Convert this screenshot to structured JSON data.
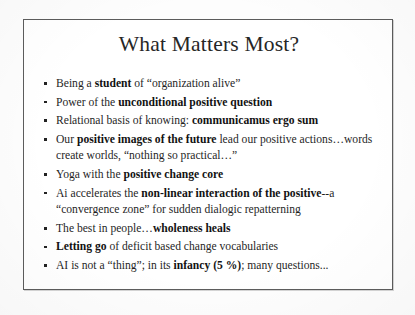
{
  "slide": {
    "title": "What Matters Most?",
    "bullets": [
      {
        "id": "bullet-student",
        "segments": [
          {
            "text": "Being a ",
            "bold": false
          },
          {
            "text": "student",
            "bold": true
          },
          {
            "text": " of “organization alive”",
            "bold": false
          }
        ]
      },
      {
        "id": "bullet-unconditional-positive-question",
        "segments": [
          {
            "text": "Power of the ",
            "bold": false
          },
          {
            "text": "unconditional positive question",
            "bold": true
          }
        ]
      },
      {
        "id": "bullet-communicamus-ergo-sum",
        "segments": [
          {
            "text": "Relational basis of knowing: ",
            "bold": false
          },
          {
            "text": "communicamus ergo sum",
            "bold": true
          }
        ]
      },
      {
        "id": "bullet-positive-images-of-the-future",
        "segments": [
          {
            "text": "Our ",
            "bold": false
          },
          {
            "text": "positive images of the future",
            "bold": true
          },
          {
            "text": " lead our positive actions…words create worlds, “nothing so practical…”",
            "bold": false
          }
        ]
      },
      {
        "id": "bullet-positive-change-core",
        "segments": [
          {
            "text": "Yoga with the ",
            "bold": false
          },
          {
            "text": "positive change core",
            "bold": true
          }
        ]
      },
      {
        "id": "bullet-non-linear-interaction",
        "segments": [
          {
            "text": "Ai accelerates the ",
            "bold": false
          },
          {
            "text": "non-linear interaction of the positive",
            "bold": true
          },
          {
            "text": "--a “convergence zone” for sudden dialogic repatterning",
            "bold": false
          }
        ]
      },
      {
        "id": "bullet-wholeness-heals",
        "segments": [
          {
            "text": "The best in people…",
            "bold": false
          },
          {
            "text": "wholeness heals",
            "bold": true
          }
        ]
      },
      {
        "id": "bullet-letting-go",
        "segments": [
          {
            "text": "Letting go",
            "bold": true
          },
          {
            "text": " of deficit based change vocabularies",
            "bold": false
          }
        ]
      },
      {
        "id": "bullet-ai-infancy",
        "segments": [
          {
            "text": "AI is not a “thing”;  in its ",
            "bold": false
          },
          {
            "text": "infancy (5 %)",
            "bold": true
          },
          {
            "text": "; many questions...",
            "bold": false
          }
        ]
      }
    ]
  },
  "style": {
    "border_color": "#5c5c5c",
    "text_color": "#1f1f1f",
    "title_color": "#262626",
    "page_background": "#fdfdfd",
    "slide_background": "#ffffff"
  }
}
